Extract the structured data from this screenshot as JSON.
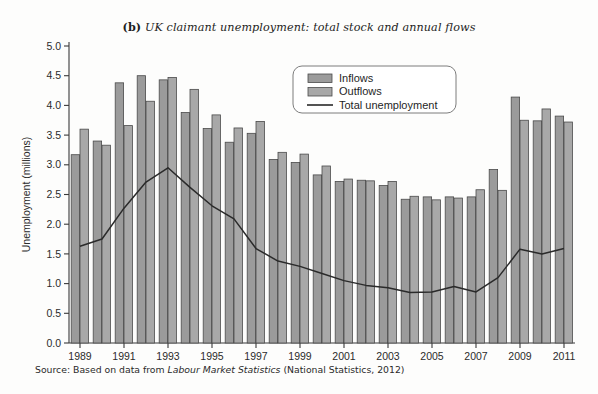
{
  "figure": {
    "title_label": "(b)",
    "title_text": "UK claimant unemployment: total stock and annual flows",
    "source_prefix": "Source: Based on data from",
    "source_italic": "Labour Market Statistics",
    "source_suffix": "(National Statistics, 2012)",
    "background": "#fdfdfc"
  },
  "legend": {
    "position": "top-center-right",
    "items": [
      {
        "label": "Inflows",
        "type": "bar",
        "color": "#9b9b9b"
      },
      {
        "label": "Outflows",
        "type": "bar",
        "color": "#a8a8a8"
      },
      {
        "label": "Total unemployment",
        "type": "line",
        "color": "#2a2a2a"
      }
    ]
  },
  "chart_data": {
    "type": "bar",
    "title": "(b) UK claimant unemployment: total stock and annual flows",
    "xlabel": "",
    "ylabel": "Unemployment (millions)",
    "ylim": [
      0.0,
      5.0
    ],
    "ytick_values": [
      0.0,
      0.5,
      1.0,
      1.5,
      2.0,
      2.5,
      3.0,
      3.5,
      4.0,
      4.5,
      5.0
    ],
    "ytick_labels": [
      "0.0",
      "0.5",
      "1.0",
      "1.5",
      "2.0",
      "2.5",
      "3.0",
      "3.5",
      "4.0",
      "4.5",
      "5.0"
    ],
    "grid": false,
    "legend_position": "upper center",
    "categories": [
      1989,
      1990,
      1991,
      1992,
      1993,
      1994,
      1995,
      1996,
      1997,
      1998,
      1999,
      2000,
      2001,
      2002,
      2003,
      2004,
      2005,
      2006,
      2007,
      2008,
      2009,
      2010,
      2011
    ],
    "xtick_labels": [
      "1989",
      "1991",
      "1993",
      "1995",
      "1997",
      "1999",
      "2001",
      "2003",
      "2005",
      "2007",
      "2009",
      "2011"
    ],
    "xtick_values": [
      1989,
      1991,
      1993,
      1995,
      1997,
      1999,
      2001,
      2003,
      2005,
      2007,
      2009,
      2011
    ],
    "series": [
      {
        "name": "Inflows",
        "type": "bar",
        "color": "#9b9b9b",
        "values": [
          3.17,
          3.4,
          4.38,
          4.5,
          4.43,
          3.88,
          3.61,
          3.38,
          3.53,
          3.09,
          3.04,
          2.83,
          2.72,
          2.74,
          2.65,
          2.42,
          2.46,
          2.46,
          2.46,
          2.92,
          4.14,
          3.74,
          3.82
        ]
      },
      {
        "name": "Outflows",
        "type": "bar",
        "color": "#a8a8a8",
        "values": [
          3.6,
          3.33,
          3.66,
          4.07,
          4.47,
          4.27,
          3.84,
          3.62,
          3.73,
          3.21,
          3.18,
          2.98,
          2.76,
          2.73,
          2.72,
          2.47,
          2.41,
          2.44,
          2.58,
          2.57,
          3.75,
          3.94,
          3.72
        ]
      },
      {
        "name": "Total unemployment",
        "type": "line",
        "color": "#2a2a2a",
        "values": [
          1.63,
          1.75,
          2.27,
          2.71,
          2.95,
          2.62,
          2.31,
          2.09,
          1.59,
          1.38,
          1.29,
          1.17,
          1.05,
          0.97,
          0.93,
          0.85,
          0.86,
          0.95,
          0.86,
          1.1,
          1.58,
          1.5,
          1.59
        ]
      }
    ]
  }
}
